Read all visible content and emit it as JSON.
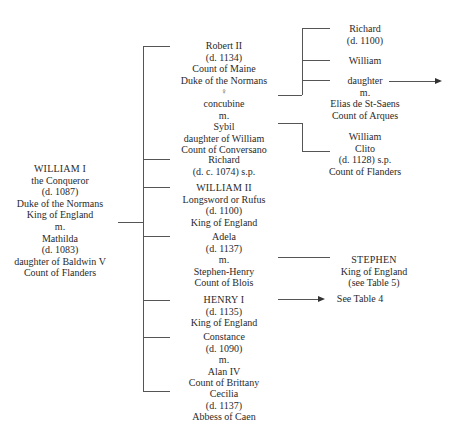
{
  "root": {
    "lines": [
      "WILLIAM I",
      "the Conqueror",
      "(d. 1087)",
      "Duke of the Normans",
      "King of England",
      "m.",
      "Mathilda",
      "(d. 1083)",
      "daughter of Baldwin V",
      "Count of Flanders"
    ]
  },
  "children": [
    {
      "id": "robert",
      "lines": [
        "Robert II",
        "(d. 1134)",
        "Count of Maine",
        "Duke of the Normans",
        "♀",
        "concubine",
        "m.",
        "Sybil",
        "daughter of William",
        "Count of Conversano"
      ]
    },
    {
      "id": "richard",
      "lines": [
        "Richard",
        "(d. c. 1074) s.p."
      ]
    },
    {
      "id": "william2",
      "lines": [
        "WILLIAM II",
        "Longsword or Rufus",
        "(d. 1100)",
        "King of England"
      ]
    },
    {
      "id": "adela",
      "lines": [
        "Adela",
        "(d. 1137)",
        "m.",
        "Stephen-Henry",
        "Count of Blois"
      ]
    },
    {
      "id": "henry1",
      "lines": [
        "HENRY I",
        "(d. 1135)",
        "King of England"
      ]
    },
    {
      "id": "constance",
      "lines": [
        "Constance",
        "(d. 1090)",
        "m.",
        "Alan IV",
        "Count of Brittany"
      ]
    },
    {
      "id": "cecilia",
      "lines": [
        "Cecilia",
        "(d. 1137)",
        "Abbess of Caen"
      ]
    }
  ],
  "grandchildren": {
    "robert_concubine": [
      {
        "id": "richard-gc",
        "lines": [
          "Richard",
          "(d. 1100)"
        ]
      },
      {
        "id": "william-gc",
        "lines": [
          "William"
        ]
      },
      {
        "id": "daughter-gc",
        "lines": [
          "daughter",
          "m.",
          "Elias de St-Saens",
          "Count of Arques"
        ]
      }
    ],
    "robert_sybil": [
      {
        "id": "william-clito",
        "lines": [
          "William",
          "Clito",
          "(d. 1128) s.p.",
          "Count of Flanders"
        ]
      }
    ],
    "adela": [
      {
        "id": "stephen",
        "lines": [
          "STEPHEN",
          "King of England",
          "(see Table 5)"
        ]
      }
    ],
    "henry1": [
      {
        "id": "henry-ref",
        "lines": [
          "See Table 4"
        ]
      }
    ]
  },
  "colors": {
    "line": "#555555",
    "text": "#2a2a2a",
    "background": "#ffffff"
  }
}
